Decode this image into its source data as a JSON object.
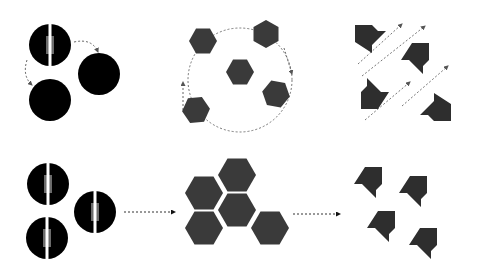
{
  "colors": {
    "background": "#ffffff",
    "circle": "#000000",
    "circle_core": "#6b6b6b",
    "hexagon": "#3a3a3a",
    "arrow_shape": "#2e2e2e",
    "dashed_line": "#666666"
  },
  "rows": [
    {
      "name": "top-row",
      "stages": [
        {
          "name": "spheres-diffusing",
          "icon": "split-sphere-with-moving-spheres"
        },
        {
          "name": "hexagons-rotating",
          "icon": "hexagons-circular-motion"
        },
        {
          "name": "arrows-translating",
          "icon": "arrow-shapes-diagonal-motion"
        }
      ]
    },
    {
      "name": "bottom-row",
      "stages": [
        {
          "name": "split-spheres-cluster",
          "icon": "three-split-spheres"
        },
        {
          "name": "hexagon-tiling",
          "icon": "five-hexagon-tiling"
        },
        {
          "name": "aligned-arrows",
          "icon": "four-aligned-arrow-shapes"
        }
      ]
    }
  ]
}
